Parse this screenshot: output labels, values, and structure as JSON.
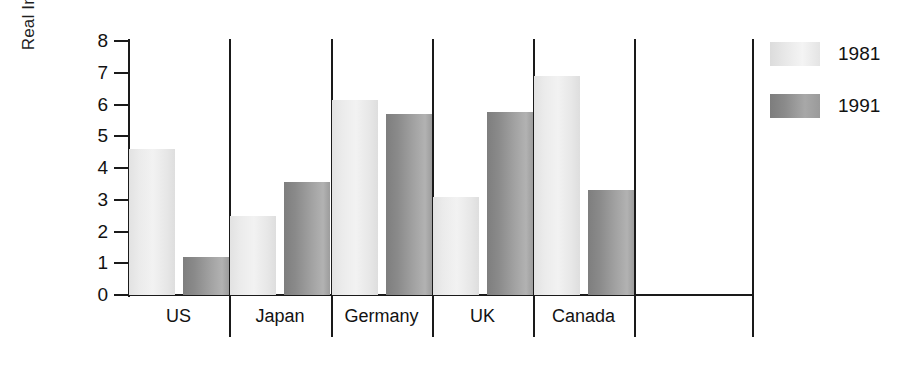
{
  "chart_data": {
    "type": "bar",
    "title": "",
    "xlabel": "",
    "ylabel": "Real Interest Rate",
    "categories": [
      "US",
      "Japan",
      "Germany",
      "UK",
      "Canada"
    ],
    "series": [
      {
        "name": "1981",
        "values": [
          4.6,
          2.5,
          6.15,
          3.1,
          6.9
        ]
      },
      {
        "name": "1991",
        "values": [
          1.2,
          3.55,
          5.7,
          5.75,
          3.3
        ]
      }
    ],
    "ylim": [
      0,
      8
    ],
    "ytick_labels": [
      "8",
      "7",
      "6",
      "5",
      "4",
      "3",
      "2",
      "1",
      "0"
    ],
    "ytick_values": [
      8,
      7,
      6,
      5,
      4,
      3,
      2,
      1,
      0
    ],
    "grid": false,
    "legend_position": "right",
    "colors": {
      "series_1981": "#ededed",
      "series_1991": "#999999",
      "axis": "#1a1a1a",
      "text": "#121212",
      "background": "#ffffff"
    }
  },
  "axis": {
    "y_title": "Real Interest Rate"
  },
  "legend": {
    "items": [
      {
        "label": "1981"
      },
      {
        "label": "1991"
      }
    ]
  },
  "categories": [
    {
      "label": "US"
    },
    {
      "label": "Japan"
    },
    {
      "label": "Germany"
    },
    {
      "label": "UK"
    },
    {
      "label": "Canada"
    }
  ],
  "yticks": [
    {
      "label": "8"
    },
    {
      "label": "7"
    },
    {
      "label": "6"
    },
    {
      "label": "5"
    },
    {
      "label": "4"
    },
    {
      "label": "3"
    },
    {
      "label": "2"
    },
    {
      "label": "1"
    },
    {
      "label": "0"
    }
  ]
}
